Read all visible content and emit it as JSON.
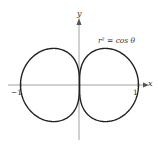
{
  "chart_data": {
    "type": "line",
    "subtype": "polar-curve",
    "title": "",
    "equation": "r^2 = cos θ",
    "equation_label": "r² = cos θ",
    "xlabel": "x",
    "ylabel": "y",
    "xlim": [
      -1.2,
      1.2
    ],
    "ylim": [
      -0.9,
      1.1
    ],
    "tick_labels": {
      "x": [
        "-1",
        "1"
      ]
    },
    "ticks": {
      "x": [
        -1,
        1
      ]
    },
    "grid": false,
    "legend": "none",
    "series": [
      {
        "name": "r^2 = cos θ (right lobe)",
        "note": "r = +sqrt(cos θ), θ ∈ [-π/2, π/2]",
        "extent": {
          "x": [
            0,
            1
          ],
          "y": [
            -0.62,
            0.62
          ]
        }
      },
      {
        "name": "r^2 = cos θ (left lobe)",
        "note": "r = -sqrt(cos θ), θ ∈ [-π/2, π/2]",
        "extent": {
          "x": [
            -1,
            0
          ],
          "y": [
            -0.62,
            0.62
          ]
        }
      }
    ],
    "colors": {
      "curve": "#222222",
      "axes": "#888888",
      "text": "#333333"
    }
  },
  "labels": {
    "y_axis": "y",
    "x_axis": "x",
    "equation": "r² = cos θ",
    "tick_neg_one": "−1",
    "tick_pos_one": "1"
  }
}
